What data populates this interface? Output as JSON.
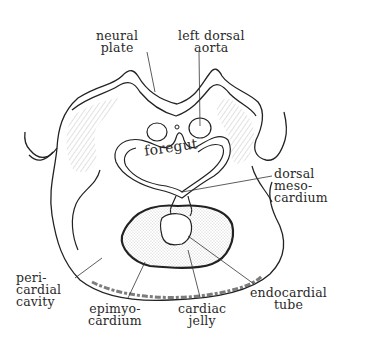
{
  "figure": {
    "labels": {
      "neural_plate": [
        "neural",
        "plate"
      ],
      "left_dorsal_aorta": [
        "left dorsal",
        "aorta"
      ],
      "foregut": "foregut",
      "dorsal_mesocardium": [
        "dorsal",
        "meso-",
        "cardium"
      ],
      "pericardial_cavity": [
        "peri-",
        "cardial",
        "cavity"
      ],
      "epimyocardium": [
        "epimyo-",
        "cardium"
      ],
      "cardiac_jelly": [
        "cardiac",
        "jelly"
      ],
      "endocardial_tube": [
        "endocardial",
        "tube"
      ]
    },
    "colors": {
      "ink": "#2a2a2a",
      "stipple": "#bdbdbd",
      "background": "#ffffff"
    }
  }
}
